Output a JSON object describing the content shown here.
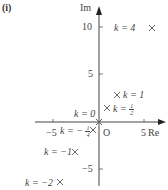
{
  "panel_label": "(i)",
  "axes": {
    "x_label": "Re",
    "y_label": "Im",
    "origin_label": "O",
    "x_ticks": [
      {
        "value": -5,
        "label": "−5"
      },
      {
        "value": 5,
        "label": "5"
      }
    ],
    "y_ticks": [
      {
        "value": 10,
        "label": "10"
      },
      {
        "value": 5,
        "label": "5"
      },
      {
        "value": -5,
        "label": "−5"
      }
    ]
  },
  "points": [
    {
      "k": "4",
      "label": "k = 4",
      "re": 5.9,
      "im": 10
    },
    {
      "k": "1",
      "label": "k = 1",
      "re": 2,
      "im": 3
    },
    {
      "k": "1/2",
      "label_prefix": "k =",
      "num": "1",
      "den": "2",
      "re": 0.8,
      "im": 1.5
    },
    {
      "k": "0",
      "label": "k = 0",
      "re": 0,
      "im": 0
    },
    {
      "k": "-1/4",
      "label_prefix": "k = −",
      "num": "1",
      "den": "4",
      "re": -0.6,
      "im": -0.8
    },
    {
      "k": "-1",
      "label": "k = −1",
      "re": -2.5,
      "im": -3.2
    },
    {
      "k": "-2",
      "label": "k = −2",
      "re": -4.3,
      "im": -6.3
    }
  ],
  "colors": {
    "axis": "#444444",
    "marker": "#555555",
    "text": "#444444"
  }
}
